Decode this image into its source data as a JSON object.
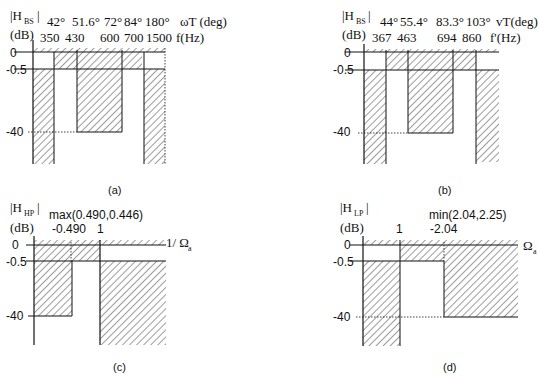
{
  "figure": {
    "panels": [
      {
        "id": "a",
        "caption": "(a)",
        "ylabel_main": "|H",
        "ylabel_sub": "BS",
        "ylabel_close": "|",
        "yunit": "(dB)",
        "top_axis_labels": [
          "42°",
          "51.6°",
          "72°",
          "84°",
          "180°"
        ],
        "top_axis_title": "ωT (deg)",
        "bottom_axis_labels": [
          "350",
          "430",
          "600",
          "700",
          "1500"
        ],
        "bottom_axis_title": "f(Hz)",
        "y_ticks": [
          "0",
          "-0.5",
          "-40"
        ]
      },
      {
        "id": "b",
        "caption": "(b)",
        "ylabel_main": "|H",
        "ylabel_sub": "BS",
        "ylabel_close": "|",
        "yunit": "(dB)",
        "top_axis_labels": [
          "44°",
          "55.4°",
          "83.3°",
          "103°"
        ],
        "top_axis_title": "vT(deg)",
        "bottom_axis_labels": [
          "367",
          "463",
          "694",
          "860"
        ],
        "bottom_axis_title": "f'(Hz)",
        "y_ticks": [
          "0",
          "-0.5",
          "-40"
        ]
      },
      {
        "id": "c",
        "caption": "(c)",
        "ylabel_main": "|H",
        "ylabel_sub": "HP",
        "ylabel_close": "|",
        "yunit": "(dB)",
        "annotation_top": "max(0.490,0.446)",
        "tick_labels": [
          "-0.490",
          "1"
        ],
        "x_axis_title": "1/ Ω",
        "x_axis_sub": "a",
        "y_ticks": [
          "0",
          "-0.5",
          "-40"
        ]
      },
      {
        "id": "d",
        "caption": "(d)",
        "ylabel_main": "|H",
        "ylabel_sub": "LP",
        "ylabel_close": "|",
        "yunit": "(dB)",
        "annotation_top": "min(2.04,2.25)",
        "tick_labels": [
          "1",
          "-2.04"
        ],
        "x_axis_title": "Ω",
        "x_axis_sub": "a",
        "y_ticks": [
          "0",
          "-0.5",
          "-40"
        ]
      }
    ]
  }
}
